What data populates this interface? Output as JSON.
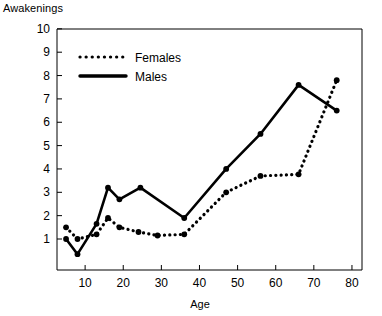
{
  "chart_data": {
    "type": "line",
    "title": "",
    "ylabel": "Awakenings",
    "xlabel": "Age",
    "xlim": [
      0,
      80
    ],
    "ylim": [
      0,
      10
    ],
    "grid": false,
    "legend_position": "top-left",
    "x_ticks": [
      10,
      20,
      30,
      40,
      50,
      60,
      70,
      80
    ],
    "y_ticks": [
      1,
      2,
      3,
      4,
      5,
      6,
      7,
      8,
      9,
      10
    ],
    "series": [
      {
        "name": "Females",
        "style": "dotted",
        "color": "#000000",
        "points": [
          {
            "x": 5,
            "y": 1.5
          },
          {
            "x": 8,
            "y": 1.0
          },
          {
            "x": 13,
            "y": 1.2
          },
          {
            "x": 16,
            "y": 1.9
          },
          {
            "x": 19,
            "y": 1.5
          },
          {
            "x": 24,
            "y": 1.3
          },
          {
            "x": 29,
            "y": 1.15
          },
          {
            "x": 36,
            "y": 1.2
          },
          {
            "x": 47,
            "y": 3.0
          },
          {
            "x": 56,
            "y": 3.7
          },
          {
            "x": 66,
            "y": 3.77
          },
          {
            "x": 76,
            "y": 7.8
          }
        ]
      },
      {
        "name": "Males",
        "style": "solid",
        "color": "#000000",
        "points": [
          {
            "x": 5,
            "y": 1.0
          },
          {
            "x": 8,
            "y": 0.35
          },
          {
            "x": 13,
            "y": 1.65
          },
          {
            "x": 16,
            "y": 3.2
          },
          {
            "x": 19,
            "y": 2.7
          },
          {
            "x": 24.5,
            "y": 3.2
          },
          {
            "x": 36,
            "y": 1.9
          },
          {
            "x": 47,
            "y": 4.0
          },
          {
            "x": 56,
            "y": 5.5
          },
          {
            "x": 66,
            "y": 7.6
          },
          {
            "x": 76,
            "y": 6.5
          }
        ]
      }
    ]
  },
  "legend": {
    "entries": [
      {
        "label": "Females",
        "style": "dotted"
      },
      {
        "label": "Males",
        "style": "solid"
      }
    ]
  },
  "axis_labels": {
    "y_title": "Awakenings",
    "x_title": "Age",
    "y_tick_labels": [
      "10",
      "9",
      "8",
      "7",
      "6",
      "5",
      "4",
      "3",
      "2",
      "1"
    ],
    "x_tick_labels": [
      "10",
      "20",
      "30",
      "40",
      "50",
      "60",
      "70",
      "80"
    ]
  }
}
